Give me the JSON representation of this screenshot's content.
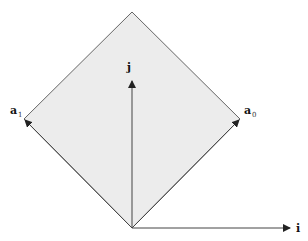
{
  "diagram": {
    "type": "lattice-basis-vectors",
    "colors": {
      "fill": "#ececec",
      "stroke": "#555555",
      "arrow": "#222222",
      "background": "#ffffff"
    },
    "region": {
      "shape": "diamond",
      "vertices": [
        [
          132,
          12
        ],
        [
          240,
          119
        ],
        [
          132,
          228
        ],
        [
          24,
          119
        ]
      ]
    },
    "origin": [
      132,
      228
    ],
    "vectors": [
      {
        "name": "j",
        "label": "j",
        "subscript": "",
        "to": [
          132,
          80
        ]
      },
      {
        "name": "a1",
        "label": "a",
        "subscript": "1",
        "to": [
          24,
          119
        ]
      },
      {
        "name": "a0",
        "label": "a",
        "subscript": "0",
        "to": [
          240,
          119
        ]
      },
      {
        "name": "i",
        "label": "i",
        "subscript": "",
        "to": [
          290,
          228
        ]
      }
    ],
    "labels": {
      "j": "j",
      "a1_main": "a",
      "a1_sub": "1",
      "a0_main": "a",
      "a0_sub": "0",
      "i": "i"
    }
  }
}
